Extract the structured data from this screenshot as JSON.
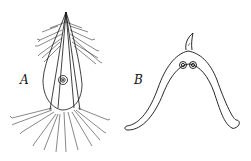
{
  "figure": {
    "panels": [
      {
        "id": "A",
        "label": "A",
        "description": "specimen with feathery plumose bristles, elongated oval body, central ringed circle"
      },
      {
        "id": "B",
        "label": "B",
        "description": "arched V-shaped structure with small hooked tip at top, two small circles near apex, curled ends"
      }
    ]
  },
  "colors": {
    "ink": "#111111",
    "background": "#ffffff"
  }
}
